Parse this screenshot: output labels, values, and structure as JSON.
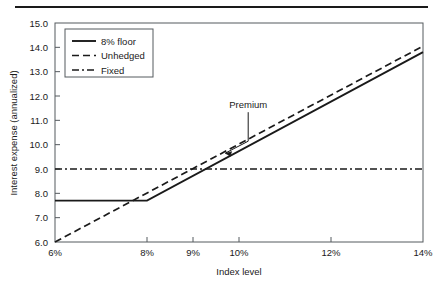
{
  "figure": {
    "background_color": "#ffffff",
    "ink_color": "#1a1a1a",
    "top_rule": "horizontal-rule"
  },
  "chart_data": {
    "type": "line",
    "title": "",
    "xlabel": "Index level",
    "ylabel": "Interest expense (annualized)",
    "xlim": [
      6,
      14
    ],
    "ylim": [
      6.0,
      15.0
    ],
    "xticks": [
      6,
      8,
      9,
      10,
      12,
      14
    ],
    "xtick_labels": [
      "6%",
      "8%",
      "9%",
      "10%",
      "12%",
      "14%"
    ],
    "yticks": [
      6.0,
      7.0,
      8.0,
      9.0,
      10.0,
      11.0,
      12.0,
      13.0,
      14.0,
      15.0
    ],
    "ytick_labels": [
      "6.0",
      "7.0",
      "8.0",
      "9.0",
      "10.0",
      "11.0",
      "12.0",
      "13.0",
      "14.0",
      "15.0"
    ],
    "grid": false,
    "legend_position": "upper left",
    "series": [
      {
        "name": "8% floor",
        "style": "solid",
        "x": [
          6,
          8,
          14
        ],
        "values": [
          7.7,
          7.7,
          13.8
        ]
      },
      {
        "name": "Unhedged",
        "style": "dashed",
        "x": [
          6,
          14
        ],
        "values": [
          6.0,
          14.05
        ]
      },
      {
        "name": "Fixed",
        "style": "dashdot",
        "x": [
          6,
          14
        ],
        "values": [
          9.0,
          9.0
        ]
      }
    ],
    "annotations": [
      {
        "text": "Premium",
        "x": 10.2,
        "y": 11.5,
        "points_to_x": 9.7,
        "points_to_y": 9.65
      }
    ]
  },
  "legend": {
    "entries": [
      {
        "label": "8% floor",
        "style": "solid"
      },
      {
        "label": "Unhedged",
        "style": "dashed"
      },
      {
        "label": "Fixed",
        "style": "dashdot"
      }
    ]
  }
}
